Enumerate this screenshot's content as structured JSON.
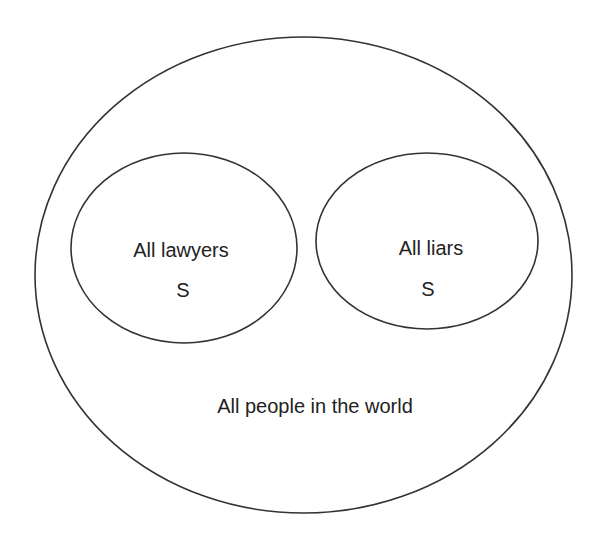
{
  "diagram": {
    "type": "euler-diagram",
    "stroke_color": "#333333",
    "background": "#ffffff",
    "universe": {
      "label": "All people in the world"
    },
    "sets": [
      {
        "label": "All lawyers",
        "marker": "S"
      },
      {
        "label": "All liars",
        "marker": "S"
      }
    ]
  }
}
